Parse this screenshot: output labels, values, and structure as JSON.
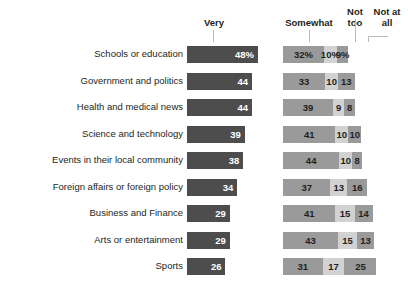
{
  "header": {
    "very": "Very",
    "somewhat": "Somewhat",
    "not_too": "Not\ntoo",
    "not_at_all": "Not at\nall"
  },
  "colors": {
    "very": "#4d4d4d",
    "somewhat": "#9a9a9a",
    "not_too": "#d2d2d2",
    "not_at_all": "#9a9a9a",
    "text": "#231f20",
    "value_on_dark": "#ffffff",
    "leader_line": "#b9b9b9",
    "background": "#ffffff"
  },
  "chart_data": {
    "type": "bar",
    "title": "",
    "subtitle": "",
    "xlabel": "",
    "ylabel": "",
    "grid": false,
    "legend_position": "top",
    "orientation": "horizontal",
    "stacked_right_panel": true,
    "unit": "percent",
    "xlim": [
      0,
      100
    ],
    "categories": [
      "Schools or education",
      "Government and politics",
      "Health and medical news",
      "Science and technology",
      "Events in their local community",
      "Foreign affairs or foreign policy",
      "Business and Finance",
      "Arts or entertainment",
      "Sports"
    ],
    "series": [
      {
        "name": "Very",
        "values": [
          48,
          44,
          44,
          39,
          38,
          34,
          29,
          29,
          26
        ]
      },
      {
        "name": "Somewhat",
        "values": [
          32,
          33,
          39,
          41,
          44,
          37,
          41,
          43,
          31
        ]
      },
      {
        "name": "Not too",
        "values": [
          10,
          10,
          9,
          10,
          10,
          13,
          15,
          15,
          17
        ]
      },
      {
        "name": "Not at all",
        "values": [
          9,
          13,
          8,
          10,
          8,
          16,
          14,
          13,
          25
        ]
      }
    ],
    "labels": {
      "very": [
        "48%",
        "44",
        "44",
        "39",
        "38",
        "34",
        "29",
        "29",
        "26"
      ],
      "somewhat": [
        "32%",
        "33",
        "39",
        "41",
        "44",
        "37",
        "41",
        "43",
        "31"
      ],
      "not_too": [
        "10%",
        "10",
        "9",
        "10",
        "10",
        "13",
        "15",
        "15",
        "17"
      ],
      "not_at_all": [
        "9%",
        "13",
        "8",
        "10",
        "8",
        "16",
        "14",
        "13",
        "25"
      ]
    }
  }
}
